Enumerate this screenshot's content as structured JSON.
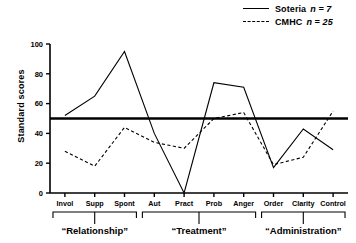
{
  "legend": {
    "entries": [
      {
        "label": "Soteria",
        "n_text": "n = 7",
        "style": "solid",
        "key_name": "legend-key-soteria"
      },
      {
        "label": "CMHC",
        "n_text": "n = 25",
        "style": "dashed",
        "key_name": "legend-key-cmhc"
      }
    ]
  },
  "axis": {
    "ylabel": "Standard scores",
    "yticks": [
      "0",
      "20",
      "40",
      "60",
      "80",
      "100"
    ]
  },
  "chart_data": {
    "type": "line",
    "title": "",
    "xlabel": "",
    "ylabel": "Standard scores",
    "ylim": [
      0,
      100
    ],
    "yticks": [
      0,
      20,
      40,
      60,
      80,
      100
    ],
    "grid": false,
    "legend_position": "top-right",
    "reference_line": {
      "value": 50,
      "style": "thick-solid",
      "label": ""
    },
    "categories": [
      "Invol",
      "Supp",
      "Spont",
      "Aut",
      "Pract",
      "Prob",
      "Anger",
      "Order",
      "Clarity",
      "Control"
    ],
    "groups": [
      {
        "label": "“Relationship”",
        "categories": [
          "Invol",
          "Supp",
          "Spont"
        ]
      },
      {
        "label": "“Treatment”",
        "categories": [
          "Aut",
          "Pract",
          "Prob",
          "Anger"
        ]
      },
      {
        "label": "“Administration”",
        "categories": [
          "Order",
          "Clarity",
          "Control"
        ]
      }
    ],
    "series": [
      {
        "name": "Soteria",
        "n": 7,
        "style": "solid",
        "values": [
          52,
          65,
          95,
          40,
          0,
          74,
          71,
          17,
          43,
          29
        ]
      },
      {
        "name": "CMHC",
        "n": 25,
        "style": "dashed",
        "values": [
          28,
          18,
          44,
          34,
          30,
          50,
          54,
          19,
          24,
          55
        ]
      }
    ]
  }
}
